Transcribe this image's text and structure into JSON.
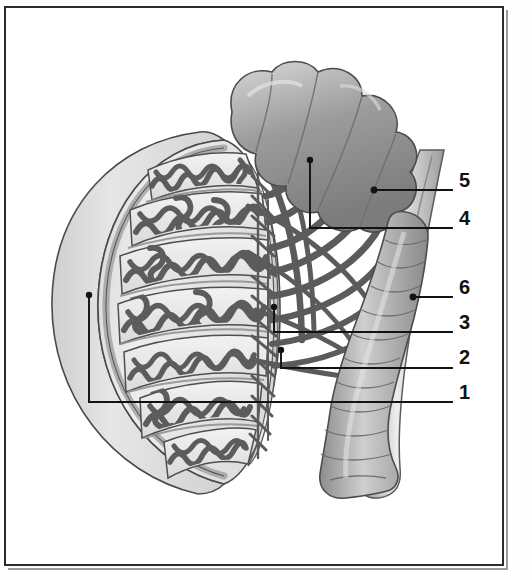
{
  "figure": {
    "width": 532,
    "height": 580,
    "background_color": "#ffffff",
    "frame_color": "#2b2b2b",
    "ink_color": "#3a3a3a"
  },
  "labels": [
    {
      "id": "label-5",
      "text": "5",
      "x": 462,
      "y": 180,
      "leader_dot": [
        374,
        190
      ],
      "structure": "head of epididymis"
    },
    {
      "id": "label-4",
      "text": "4",
      "x": 462,
      "y": 218,
      "leader_dot": [
        310,
        160
      ],
      "structure": "efferent ductules"
    },
    {
      "id": "label-6",
      "text": "6",
      "x": 462,
      "y": 287,
      "leader_dot": [
        413,
        297
      ],
      "structure": "ductus deferens"
    },
    {
      "id": "label-3",
      "text": "3",
      "x": 462,
      "y": 322,
      "leader_dot": [
        274,
        307
      ],
      "structure": "rete testis / mediastinum"
    },
    {
      "id": "label-2",
      "text": "2",
      "x": 462,
      "y": 357,
      "leader_dot": [
        281,
        350
      ],
      "structure": "septum of testis"
    },
    {
      "id": "label-1",
      "text": "1",
      "x": 462,
      "y": 392,
      "leader_dot": [
        89,
        295
      ],
      "structure": "tunica albuginea"
    }
  ],
  "leader_lines": [
    {
      "id": "leader-5",
      "path": "M 374 190 L 452 190"
    },
    {
      "id": "leader-4",
      "path": "M 310 160 L 310 228 L 452 228"
    },
    {
      "id": "leader-6",
      "path": "M 413 297 L 452 297"
    },
    {
      "id": "leader-3",
      "path": "M 274 307 L 274 332 L 452 332"
    },
    {
      "id": "leader-2",
      "path": "M 281 350 L 281 368 L 452 368"
    },
    {
      "id": "leader-1",
      "path": "M 89 295 L 89 402 L 452 402"
    }
  ],
  "structures": {
    "testis": {
      "name": "testis",
      "lobule_count": 7,
      "fill": "#e8e8e8"
    },
    "tunica": {
      "name": "tunica vaginalis / albuginea",
      "fill": "#dcdcdc"
    },
    "epididymis_head": {
      "name": "head of epididymis",
      "fill": "#a8a8a8"
    },
    "epididymis_body": {
      "name": "body and tail of epididymis",
      "fill": "#b4b4b4"
    },
    "ductus_deferens": {
      "name": "ductus deferens",
      "fill": "#cccccc"
    },
    "efferent_ductules": {
      "name": "efferent ductules",
      "fill": "#666666"
    },
    "seminiferous_tubules": {
      "name": "seminiferous tubules",
      "stroke": "#5a5a5a"
    }
  }
}
